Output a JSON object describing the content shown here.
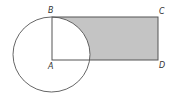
{
  "diagram": {
    "points": {
      "A": {
        "label": "A",
        "x": 52,
        "y": 60
      },
      "B": {
        "label": "B",
        "x": 52,
        "y": 17
      },
      "C": {
        "label": "C",
        "x": 158,
        "y": 17
      },
      "D": {
        "label": "D",
        "x": 158,
        "y": 60
      }
    },
    "circle": {
      "center": "A",
      "cx": 51.5,
      "cy": 54.5,
      "rx": 38.5,
      "ry": 37.5
    },
    "rectangle": [
      "A",
      "B",
      "C",
      "D"
    ],
    "shaded_region": "rectangle ABCD outside circle",
    "colors": {
      "stroke": "#555555",
      "shade": "#c4c4c4",
      "background": "#ffffff"
    }
  }
}
